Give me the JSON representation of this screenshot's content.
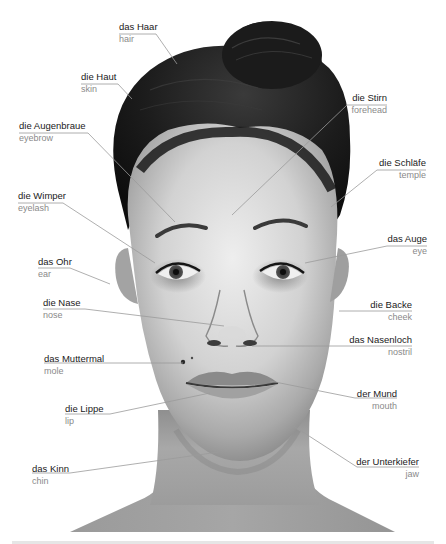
{
  "diagram": {
    "labels": [
      {
        "id": "hair",
        "de": "das Haar",
        "en": "hair",
        "x": 119,
        "y": 21,
        "align": "left",
        "line": [
          [
            119,
            34
          ],
          [
            156,
            34
          ],
          [
            177,
            64
          ]
        ]
      },
      {
        "id": "skin",
        "de": "die Haut",
        "en": "skin",
        "x": 81,
        "y": 71,
        "align": "left",
        "line": [
          [
            81,
            84
          ],
          [
            118,
            84
          ],
          [
            132,
            99
          ]
        ]
      },
      {
        "id": "eyebrow",
        "de": "die Augenbraue",
        "en": "eyebrow",
        "x": 19,
        "y": 120,
        "align": "left",
        "line": [
          [
            19,
            133
          ],
          [
            88,
            133
          ],
          [
            175,
            222
          ]
        ]
      },
      {
        "id": "forehead",
        "de": "die Stirn",
        "en": "forehead",
        "x": 355,
        "y": 92,
        "align": "right",
        "line": [
          [
            387,
            105
          ],
          [
            347,
            105
          ],
          [
            232,
            215
          ]
        ]
      },
      {
        "id": "temple",
        "de": "die Schläfe",
        "en": "temple",
        "x": 382,
        "y": 157,
        "align": "right",
        "line": [
          [
            426,
            170
          ],
          [
            377,
            170
          ],
          [
            331,
            207
          ]
        ]
      },
      {
        "id": "eyelash",
        "de": "die Wimper",
        "en": "eyelash",
        "x": 18,
        "y": 190,
        "align": "left",
        "line": [
          [
            18,
            203
          ],
          [
            63,
            203
          ],
          [
            155,
            263
          ]
        ]
      },
      {
        "id": "eye",
        "de": "das Auge",
        "en": "eye",
        "x": 377,
        "y": 233,
        "align": "right",
        "line": [
          [
            427,
            246
          ],
          [
            387,
            246
          ],
          [
            305,
            263
          ]
        ]
      },
      {
        "id": "ear",
        "de": "das Ohr",
        "en": "ear",
        "x": 38,
        "y": 256,
        "align": "left",
        "line": [
          [
            38,
            268
          ],
          [
            70,
            268
          ],
          [
            110,
            284
          ]
        ]
      },
      {
        "id": "nose",
        "de": "die Nase",
        "en": "nose",
        "x": 43,
        "y": 297,
        "align": "left",
        "line": [
          [
            43,
            309
          ],
          [
            85,
            309
          ],
          [
            224,
            326
          ]
        ]
      },
      {
        "id": "cheek",
        "de": "die Backe",
        "en": "cheek",
        "x": 370,
        "y": 299,
        "align": "right",
        "line": [
          [
            412,
            311
          ],
          [
            339,
            311
          ]
        ]
      },
      {
        "id": "nostril",
        "de": "das Nasenloch",
        "en": "nostril",
        "x": 351,
        "y": 334,
        "align": "right",
        "line": [
          [
            412,
            346
          ],
          [
            252,
            346
          ]
        ]
      },
      {
        "id": "mole",
        "de": "das Muttermal",
        "en": "mole",
        "x": 44,
        "y": 353,
        "align": "left",
        "line": [
          [
            44,
            363
          ],
          [
            183,
            363
          ]
        ]
      },
      {
        "id": "lip",
        "de": "die Lippe",
        "en": "lip",
        "x": 65,
        "y": 403,
        "align": "left",
        "line": [
          [
            65,
            414
          ],
          [
            110,
            414
          ],
          [
            210,
            393
          ]
        ]
      },
      {
        "id": "mouth",
        "de": "der Mund",
        "en": "mouth",
        "x": 353,
        "y": 388,
        "align": "right",
        "line": [
          [
            397,
            398
          ],
          [
            355,
            398
          ],
          [
            270,
            381
          ]
        ]
      },
      {
        "id": "jaw",
        "de": "der Unterkiefer",
        "en": "jaw",
        "x": 360,
        "y": 456,
        "align": "right",
        "line": [
          [
            419,
            467
          ],
          [
            357,
            467
          ],
          [
            292,
            425
          ]
        ]
      },
      {
        "id": "chin",
        "de": "das Kinn",
        "en": "chin",
        "x": 32,
        "y": 463,
        "align": "left",
        "line": [
          [
            32,
            473
          ],
          [
            70,
            473
          ],
          [
            219,
            452
          ]
        ]
      }
    ],
    "colors": {
      "label_primary": "#1a1a1a",
      "label_secondary": "#8a8a8a",
      "leader_line": "#9a9a9a",
      "skin_light": "#e9e9e9",
      "skin_mid": "#bdbdbd",
      "skin_dark": "#8c8c8c",
      "hair": "#151515"
    }
  }
}
